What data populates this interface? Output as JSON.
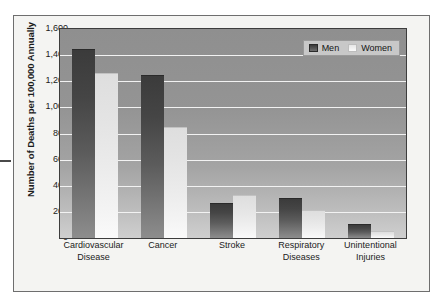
{
  "chart_data": {
    "type": "bar",
    "title": "",
    "subtitle": "",
    "xlabel": "",
    "ylabel": "Number of Deaths per 100,000 Annually",
    "ylim": [
      0,
      1600
    ],
    "y_ticks": [
      0,
      200,
      400,
      600,
      800,
      1000,
      1200,
      1400,
      1600
    ],
    "y_tick_labels": [
      "0",
      "200",
      "400",
      "600",
      "800",
      "1,000",
      "1,200",
      "1,400",
      "1,600"
    ],
    "grid": true,
    "grid_axis": "y",
    "legend_position": "top-right",
    "categories": [
      "Cardiovascular Disease",
      "Cancer",
      "Stroke",
      "Respiratory Diseases",
      "Unintentional Injuries"
    ],
    "category_lines": [
      [
        "Cardiovascular",
        "Disease"
      ],
      [
        "Cancer",
        ""
      ],
      [
        "Stroke",
        ""
      ],
      [
        "Respiratory",
        "Diseases"
      ],
      [
        "Unintentional",
        "Injuries"
      ]
    ],
    "series": [
      {
        "name": "Men",
        "color": "#454545",
        "values": [
          1450,
          1250,
          270,
          310,
          110
        ]
      },
      {
        "name": "Women",
        "color": "#ececec",
        "values": [
          1260,
          850,
          330,
          215,
          55
        ]
      }
    ]
  },
  "legend": {
    "entries": [
      {
        "label": "Men",
        "swatch": "men-swatch"
      },
      {
        "label": "Women",
        "swatch": "women-swatch"
      }
    ]
  },
  "colors": {
    "plot_background_top": "#8f8f8f",
    "plot_background_bottom": "#cfcfcf",
    "gridline": "#f2f2f2",
    "axis_border": "#3d3d3d",
    "figure_background": "#f4f4f2",
    "figure_border": "#6e6e6e",
    "text": "#1b1b1b",
    "legend_background": "#c8c8c8"
  }
}
